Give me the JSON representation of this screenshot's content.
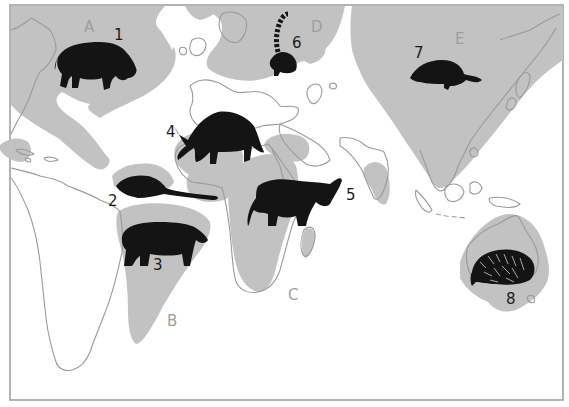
{
  "map": {
    "title": "World distribution map of mammal groups",
    "colors": {
      "region_fill": "#c2c2c2",
      "coastline": "#9a9a9a",
      "animal_silhouette": "#141414",
      "frame": "#9a9a9a",
      "background": "#ffffff"
    },
    "regions": [
      {
        "id": "A",
        "label": "A",
        "area": "North America / North Atlantic"
      },
      {
        "id": "B",
        "label": "B",
        "area": "South America"
      },
      {
        "id": "C",
        "label": "C",
        "area": "Africa"
      },
      {
        "id": "D",
        "label": "D",
        "area": "Northern Eurasia"
      },
      {
        "id": "E",
        "label": "E",
        "area": "Asia"
      }
    ],
    "animals": [
      {
        "number": "1",
        "icon": "rhinoceros-icon"
      },
      {
        "number": "2",
        "icon": "opossum-icon"
      },
      {
        "number": "3",
        "icon": "tapir-icon"
      },
      {
        "number": "4",
        "icon": "aardvark-icon"
      },
      {
        "number": "5",
        "icon": "elephant-icon"
      },
      {
        "number": "6",
        "icon": "lemur-icon"
      },
      {
        "number": "7",
        "icon": "shrew-icon"
      },
      {
        "number": "8",
        "icon": "echidna-icon"
      }
    ]
  }
}
